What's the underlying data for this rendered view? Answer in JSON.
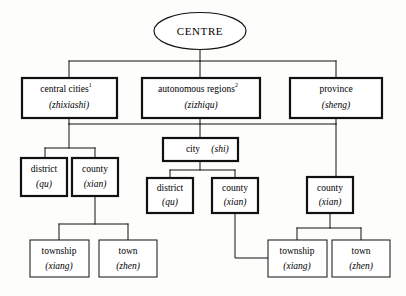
{
  "diagram": {
    "background_color": "#fdfdfb",
    "line_color": "#111111",
    "box_fill": "#ffffff",
    "root": {
      "label": "CENTRE",
      "shape": "ellipse"
    },
    "level1": [
      {
        "label_en": "central cities",
        "superscript": "1",
        "label_pinyin": "(zhixiashi)",
        "border": "thick"
      },
      {
        "label_en": "autonomous regions",
        "superscript": "2",
        "label_pinyin": "(zizhiqu)",
        "border": "thick"
      },
      {
        "label_en": "province",
        "superscript": "",
        "label_pinyin": "(sheng)",
        "border": "thick"
      }
    ],
    "level2": [
      {
        "label_en": "city",
        "label_pinyin": "(shi)",
        "inline": "city (shi)",
        "border": "thick",
        "parent": "autonomous regions"
      }
    ],
    "level3": [
      {
        "label_en": "district",
        "label_pinyin": "(qu)",
        "border": "thick",
        "branch": "central-cities"
      },
      {
        "label_en": "county",
        "label_pinyin": "(xian)",
        "border": "thick",
        "branch": "central-cities"
      },
      {
        "label_en": "district",
        "label_pinyin": "(qu)",
        "border": "thick",
        "branch": "city"
      },
      {
        "label_en": "county",
        "label_pinyin": "(xian)",
        "border": "thick",
        "branch": "city"
      },
      {
        "label_en": "county",
        "label_pinyin": "(xian)",
        "border": "thick",
        "branch": "province"
      }
    ],
    "level4": [
      {
        "label_en": "township",
        "label_pinyin": "(xiang)",
        "border": "thin",
        "branch": "central-cities-county"
      },
      {
        "label_en": "town",
        "label_pinyin": "(zhen)",
        "border": "thin",
        "branch": "central-cities-county"
      },
      {
        "label_en": "township",
        "label_pinyin": "(xiang)",
        "border": "thin",
        "branch": "province-county"
      },
      {
        "label_en": "town",
        "label_pinyin": "(zhen)",
        "border": "thin",
        "branch": "province-county"
      }
    ]
  }
}
